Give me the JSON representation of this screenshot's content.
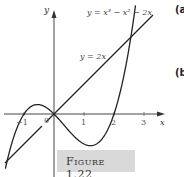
{
  "chart_data": {
    "type": "line",
    "title": "",
    "xlabel": "x",
    "ylabel": "y",
    "xlim": [
      -1.7,
      3.7
    ],
    "ylim": [
      -4.2,
      6.8
    ],
    "grid": false,
    "x_ticks": [
      "-1",
      "0",
      "1",
      "2",
      "3"
    ],
    "series": [
      {
        "name": "y = x^3 - x^2 - 2x",
        "label": "y = x³ − x² − 2x",
        "function": "x^3 - x^2 - 2x",
        "x": [
          -1.6,
          -1.4,
          -1.2,
          -1.0,
          -0.8,
          -0.55,
          -0.3,
          0,
          0.3,
          0.6,
          0.9,
          1.22,
          1.5,
          1.8,
          2.0,
          2.3,
          2.6,
          2.8,
          3.0,
          3.1
        ],
        "y": [
          -3.46,
          -1.9,
          -0.77,
          0.0,
          0.45,
          0.63,
          0.48,
          0.0,
          -0.66,
          -1.34,
          -1.88,
          -2.11,
          -1.88,
          -0.94,
          0.0,
          1.58,
          3.96,
          5.71,
          6.0,
          9.3
        ]
      },
      {
        "name": "y = 2x",
        "label": "y = 2x",
        "function": "2x",
        "x": [
          -1.65,
          3.3
        ],
        "y": [
          -3.3,
          6.6
        ]
      }
    ],
    "intersections": [
      {
        "x": -1,
        "y": -2
      },
      {
        "x": 0,
        "y": 0
      },
      {
        "x": 3,
        "y": 6
      }
    ],
    "annotations": [
      "y = x³ − x² − 2x",
      "y = 2x"
    ],
    "caption": "Figure 1.22"
  },
  "axes": {
    "x_label": "x",
    "y_label": "y",
    "ticks": {
      "neg1": "−1",
      "zero": "0",
      "one": "1",
      "two": "2",
      "three": "3"
    }
  },
  "labels": {
    "cubic": "y = x³ − x² − 2x",
    "line": "y = 2x"
  },
  "caption": "Figure 1.22",
  "side_labels": {
    "a": "(a",
    "b": "(b"
  }
}
